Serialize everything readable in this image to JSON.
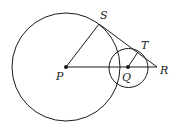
{
  "diagram": {
    "type": "geometry",
    "colors": {
      "stroke": "#1a1a1a",
      "background": "#ffffff"
    },
    "points": {
      "P": {
        "label": "P",
        "x": 66,
        "y": 67
      },
      "Q": {
        "label": "Q",
        "x": 128,
        "y": 67
      },
      "R": {
        "label": "R",
        "x": 157,
        "y": 67
      },
      "S": {
        "label": "S",
        "x": 99,
        "y": 24
      },
      "T": {
        "label": "T",
        "x": 138,
        "y": 51
      }
    },
    "circles": [
      {
        "name": "circle-P",
        "center": "P",
        "r": 54
      },
      {
        "name": "circle-Q",
        "center": "Q",
        "r": 19.5
      }
    ],
    "segments": [
      {
        "name": "PS",
        "from": "P",
        "to": "S"
      },
      {
        "name": "PR",
        "from": "P",
        "to": "R"
      },
      {
        "name": "SR",
        "from": "S",
        "to": "R"
      },
      {
        "name": "QT",
        "from": "Q",
        "to": "T"
      }
    ]
  }
}
